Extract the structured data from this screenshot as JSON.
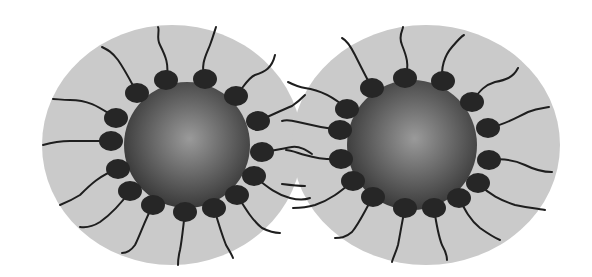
{
  "diagram": {
    "colors": {
      "shell": "#cacaca",
      "core_dark": "#3a3a3a",
      "core_light": "#9a9a9a",
      "head": "#262626",
      "tail": "#1e1e1e",
      "background": "#ffffff"
    },
    "particles": [
      {
        "name": "left-particle",
        "shell": {
          "cx": 172,
          "cy": 145,
          "rx": 130,
          "ry": 120
        },
        "core": {
          "cx": 187,
          "cy": 145,
          "r": 63
        },
        "heads": [
          {
            "x": 166,
            "y": 80,
            "tail": "M166,80 C170,65 165,55 160,45 C156,38 160,30 158,27"
          },
          {
            "x": 205,
            "y": 79,
            "tail": "M205,79 C200,65 206,55 210,45 C213,37 215,30 216,27"
          },
          {
            "x": 137,
            "y": 93,
            "tail": "M137,93 C130,80 125,70 118,60 C112,52 108,50 102,47"
          },
          {
            "x": 236,
            "y": 96,
            "tail": "M236,96 C245,85 248,78 255,75 C265,72 272,68 275,55"
          },
          {
            "x": 116,
            "y": 118,
            "tail": "M116,118 C100,108 90,100 70,100 C62,100 57,99 53,99"
          },
          {
            "x": 258,
            "y": 121,
            "tail": "M258,121 C272,115 282,110 292,106 C298,102 303,97 305,95"
          },
          {
            "x": 111,
            "y": 141,
            "tail": "M111,141 C95,141 85,141 70,141 C58,141 50,143 43,145"
          },
          {
            "x": 262,
            "y": 152,
            "tail": "M262,152 C278,150 285,148 292,147 C300,146 306,150 312,154"
          },
          {
            "x": 118,
            "y": 169,
            "tail": "M118,169 C100,175 90,185 80,195 C72,200 65,203 60,205"
          },
          {
            "x": 254,
            "y": 176,
            "tail": "M254,176 C268,188 278,195 290,198 C298,200 305,200 310,198"
          },
          {
            "x": 130,
            "y": 191,
            "tail": "M130,191 C120,205 110,215 100,222 C92,227 86,228 80,227"
          },
          {
            "x": 237,
            "y": 195,
            "tail": "M237,195 C245,208 252,220 262,228 C270,232 275,233 280,233"
          },
          {
            "x": 153,
            "y": 205,
            "tail": "M153,205 C145,220 140,235 135,245 C130,252 126,253 122,253"
          },
          {
            "x": 214,
            "y": 208,
            "tail": "M214,208 C218,222 222,235 226,245 C230,252 232,255 233,258"
          },
          {
            "x": 185,
            "y": 212,
            "tail": "M185,212 C183,228 182,240 180,250 C178,258 178,262 178,265"
          }
        ]
      },
      {
        "name": "right-particle",
        "shell": {
          "cx": 426,
          "cy": 145,
          "rx": 134,
          "ry": 120
        },
        "core": {
          "cx": 412,
          "cy": 145,
          "r": 65
        },
        "heads": [
          {
            "x": 405,
            "y": 78,
            "tail": "M405,78 C410,65 406,55 402,45 C398,35 403,30 403,27"
          },
          {
            "x": 443,
            "y": 81,
            "tail": "M443,81 C440,68 445,55 452,47 C458,40 462,36 464,35"
          },
          {
            "x": 372,
            "y": 88,
            "tail": "M372,88 C365,75 360,65 355,55 C350,45 346,40 342,38"
          },
          {
            "x": 472,
            "y": 102,
            "tail": "M472,102 C480,90 485,85 495,82 C505,80 513,78 518,68"
          },
          {
            "x": 347,
            "y": 109,
            "tail": "M347,109 C335,98 320,90 305,88 C298,87 292,84 288,82"
          },
          {
            "x": 488,
            "y": 128,
            "tail": "M488,128 C505,125 515,118 528,112 C538,108 545,108 549,107"
          },
          {
            "x": 340,
            "y": 130,
            "tail": "M340,130 C325,128 310,125 298,122 C290,120 285,120 282,121"
          },
          {
            "x": 489,
            "y": 160,
            "tail": "M489,160 C505,158 515,160 525,165 C535,170 545,172 552,172"
          },
          {
            "x": 341,
            "y": 159,
            "tail": "M341,159 C325,160 315,158 305,155 C295,152 290,150 286,150"
          },
          {
            "x": 478,
            "y": 183,
            "tail": "M478,183 C490,195 500,200 515,205 C530,208 540,209 545,210"
          },
          {
            "x": 353,
            "y": 181,
            "tail": "M353,181 C340,192 330,200 315,205 C305,208 298,208 293,208"
          },
          {
            "x": 459,
            "y": 198,
            "tail": "M459,198 C465,210 470,220 480,228 C490,235 495,238 500,240"
          },
          {
            "x": 373,
            "y": 197,
            "tail": "M373,197 C365,210 360,222 352,232 C345,238 340,238 335,238"
          },
          {
            "x": 405,
            "y": 208,
            "tail": "M405,208 C402,222 400,235 398,245 C396,252 393,258 392,262"
          },
          {
            "x": 434,
            "y": 208,
            "tail": "M434,208 C436,222 438,235 442,245 C446,252 447,255 447,260"
          }
        ]
      }
    ],
    "stray_tails": [
      "M282,184 C290,185 298,186 305,186"
    ]
  }
}
